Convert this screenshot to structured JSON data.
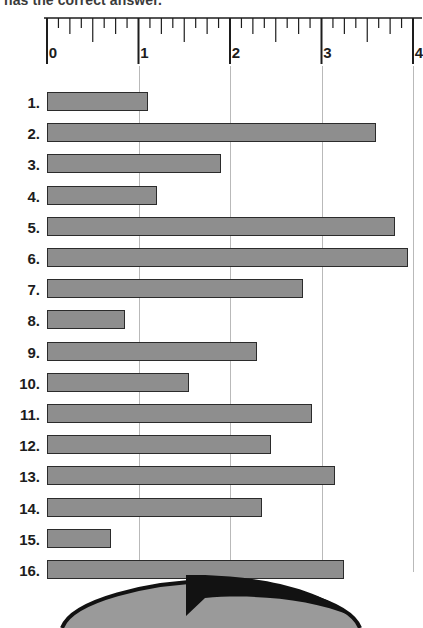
{
  "heading": {
    "text": "has the correct answer."
  },
  "ruler": {
    "axis_min": 0,
    "axis_max": 4,
    "minor_divisions_per_unit": 8,
    "tick_labels": [
      "0",
      "1",
      "2",
      "3",
      "4"
    ],
    "line_color": "#1d1d1d"
  },
  "chart_data": {
    "type": "bar",
    "orientation": "horizontal",
    "title": "",
    "xlabel": "",
    "ylabel": "",
    "xlim": [
      0,
      4
    ],
    "grid": true,
    "gridlines_at": [
      1,
      2,
      3,
      4
    ],
    "bar_color": "#8e8e8e",
    "bar_border_color": "#2b2b2b",
    "categories": [
      "1.",
      "2.",
      "3.",
      "4.",
      "5.",
      "6.",
      "7.",
      "8.",
      "9.",
      "10.",
      "11.",
      "12.",
      "13.",
      "14.",
      "15.",
      "16."
    ],
    "values": [
      1.1,
      3.6,
      1.9,
      1.2,
      3.8,
      3.95,
      2.8,
      0.85,
      2.3,
      1.55,
      2.9,
      2.45,
      3.15,
      2.35,
      0.7,
      3.25
    ],
    "rows": [
      {
        "label": "1.",
        "value": 1.1
      },
      {
        "label": "2.",
        "value": 3.6
      },
      {
        "label": "3.",
        "value": 1.9
      },
      {
        "label": "4.",
        "value": 1.2
      },
      {
        "label": "5.",
        "value": 3.8
      },
      {
        "label": "6.",
        "value": 3.95
      },
      {
        "label": "7.",
        "value": 2.8
      },
      {
        "label": "8.",
        "value": 0.85
      },
      {
        "label": "9.",
        "value": 2.3
      },
      {
        "label": "10.",
        "value": 1.55
      },
      {
        "label": "11.",
        "value": 2.9
      },
      {
        "label": "12.",
        "value": 2.45
      },
      {
        "label": "13.",
        "value": 3.15
      },
      {
        "label": "14.",
        "value": 2.35
      },
      {
        "label": "15.",
        "value": 0.7
      },
      {
        "label": "16.",
        "value": 3.25
      }
    ]
  },
  "artwork": {
    "name": "arrow-over-ellipse-illustration",
    "arrow_color": "#121212",
    "shape_color": "#9a9a9a"
  }
}
